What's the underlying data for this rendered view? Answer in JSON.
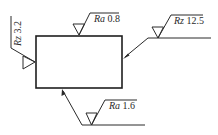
{
  "diagram": {
    "title": "",
    "part_outline": "rectangle",
    "symbols": [
      {
        "id": "top",
        "param": "Ra",
        "value": "0.8",
        "surface": "top",
        "attached": "direct"
      },
      {
        "id": "right",
        "param": "Rz",
        "value": "12.5",
        "surface": "right",
        "attached": "leader"
      },
      {
        "id": "left",
        "param": "Rz",
        "value": "3.2",
        "surface": "left",
        "attached": "direct-rotated"
      },
      {
        "id": "bottom",
        "param": "Ra",
        "value": "1.6",
        "surface": "bottom",
        "attached": "leader"
      }
    ],
    "colors": {
      "stroke": "#2a2a2a",
      "background": "#ffffff"
    }
  }
}
